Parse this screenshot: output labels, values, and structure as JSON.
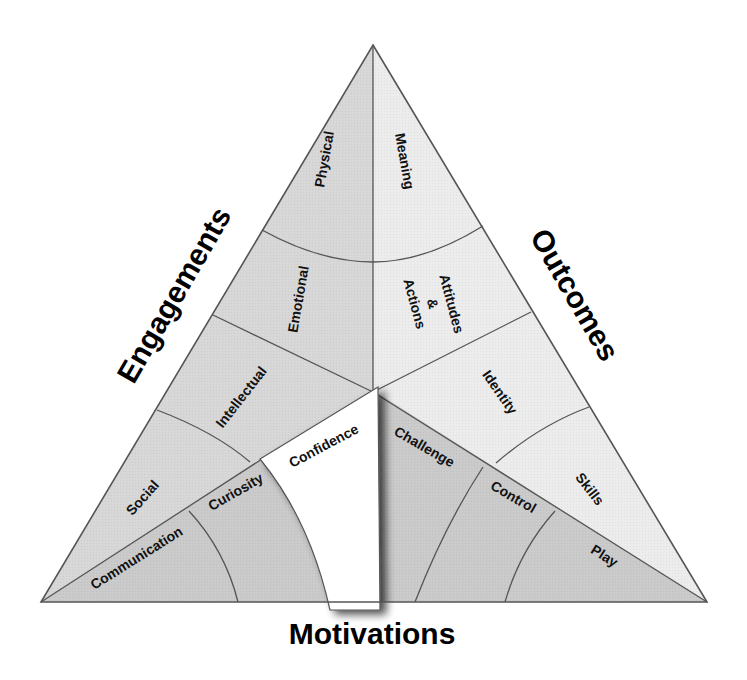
{
  "colors": {
    "engagements_fill": "#d7d7d7",
    "outcomes_fill": "#ebebeb",
    "motivations_fill": "#c9c9c9",
    "confidence_fill": "#ffffff",
    "line": "#555555",
    "text": "#111111"
  },
  "axes": {
    "left": "Engagements",
    "right": "Outcomes",
    "bottom": "Motivations"
  },
  "engagements": {
    "regions": [
      {
        "label": "Physical"
      },
      {
        "label": "Emotional"
      },
      {
        "label": "Intellectual"
      },
      {
        "label": "Social"
      },
      {
        "label": "Communication"
      }
    ]
  },
  "outcomes": {
    "regions": [
      {
        "label": "Meaning"
      },
      {
        "label": "Attitudes"
      },
      {
        "label": "&"
      },
      {
        "label": "Actions"
      },
      {
        "label": "Identity"
      },
      {
        "label": "Skills"
      }
    ]
  },
  "motivations": {
    "regions": [
      {
        "label": "Curiosity"
      },
      {
        "label": "Confidence"
      },
      {
        "label": "Challenge"
      },
      {
        "label": "Control"
      },
      {
        "label": "Play"
      }
    ]
  }
}
